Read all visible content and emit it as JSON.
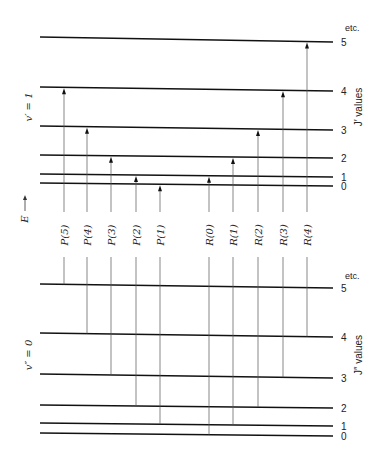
{
  "diagram": {
    "upper_state": {
      "label": "v′ = 1",
      "axis_label": "J′ values",
      "etc_label": "etc.",
      "levels": [
        {
          "J": "0",
          "y_left": 183,
          "y_right": 186
        },
        {
          "J": "1",
          "y_left": 174,
          "y_right": 177
        },
        {
          "J": "2",
          "y_left": 155,
          "y_right": 158
        },
        {
          "J": "3",
          "y_left": 126,
          "y_right": 130
        },
        {
          "J": "4",
          "y_left": 87,
          "y_right": 91
        },
        {
          "J": "5",
          "y_left": 37,
          "y_right": 42
        }
      ]
    },
    "lower_state": {
      "label": "v″ = 0",
      "axis_label": "J″ values",
      "etc_label": "etc.",
      "levels": [
        {
          "J": "0",
          "y_left": 433,
          "y_right": 436
        },
        {
          "J": "1",
          "y_left": 423,
          "y_right": 426
        },
        {
          "J": "2",
          "y_left": 405,
          "y_right": 408
        },
        {
          "J": "3",
          "y_left": 374,
          "y_right": 378
        },
        {
          "J": "4",
          "y_left": 333,
          "y_right": 337
        },
        {
          "J": "5",
          "y_left": 284,
          "y_right": 288
        }
      ]
    },
    "energy_axis_label": "E",
    "transitions": [
      {
        "label": "P(5)",
        "x": 64,
        "from_J": 5,
        "to_J": 4
      },
      {
        "label": "P(4)",
        "x": 87,
        "from_J": 4,
        "to_J": 3
      },
      {
        "label": "P(3)",
        "x": 111,
        "from_J": 3,
        "to_J": 2
      },
      {
        "label": "P(2)",
        "x": 136,
        "from_J": 2,
        "to_J": 1
      },
      {
        "label": "P(1)",
        "x": 160,
        "from_J": 1,
        "to_J": 0
      },
      {
        "label": "R(0)",
        "x": 209,
        "from_J": 0,
        "to_J": 1
      },
      {
        "label": "R(1)",
        "x": 233,
        "from_J": 1,
        "to_J": 2
      },
      {
        "label": "R(2)",
        "x": 258,
        "from_J": 2,
        "to_J": 3
      },
      {
        "label": "R(3)",
        "x": 283,
        "from_J": 3,
        "to_J": 4
      },
      {
        "label": "R(4)",
        "x": 307,
        "from_J": 4,
        "to_J": 5
      }
    ],
    "colors": {
      "line": "#111111",
      "transition": "#555555"
    }
  }
}
